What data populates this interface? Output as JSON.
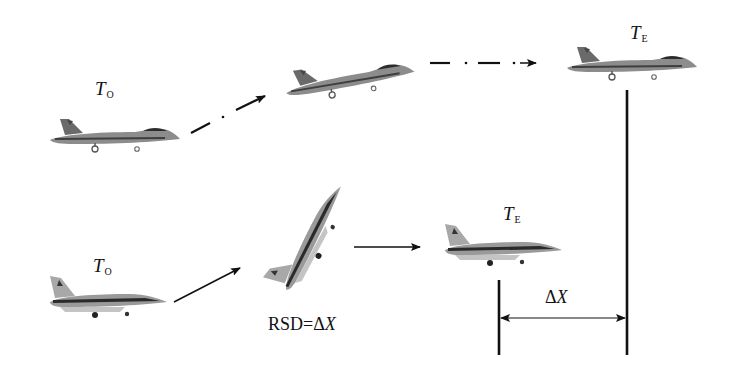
{
  "diagram": {
    "type": "aircraft-maneuver-comparison",
    "top_row": {
      "start_label": {
        "main": "T",
        "sub": "O"
      },
      "end_label": {
        "main": "T",
        "sub": "E"
      },
      "aircraft": "fighter-jet-twin-tail",
      "path_style": "dash-dot",
      "stages": [
        "level flight",
        "climbing",
        "level flight"
      ]
    },
    "bottom_row": {
      "start_label": {
        "main": "T",
        "sub": "O"
      },
      "end_label": {
        "main": "T",
        "sub": "E"
      },
      "aircraft": "fighter-jet-single-tail",
      "path_style": "solid",
      "stages": [
        "level flight",
        "steep pitch-up",
        "level flight"
      ],
      "equation": {
        "prefix": "RSD=Δ",
        "var": "X"
      }
    },
    "distance": {
      "prefix": "Δ",
      "var": "X"
    },
    "colors": {
      "ink": "#111111",
      "aircraft_body": "#8a8a8a",
      "aircraft_dark": "#3c3c3c",
      "background": "#ffffff"
    }
  }
}
